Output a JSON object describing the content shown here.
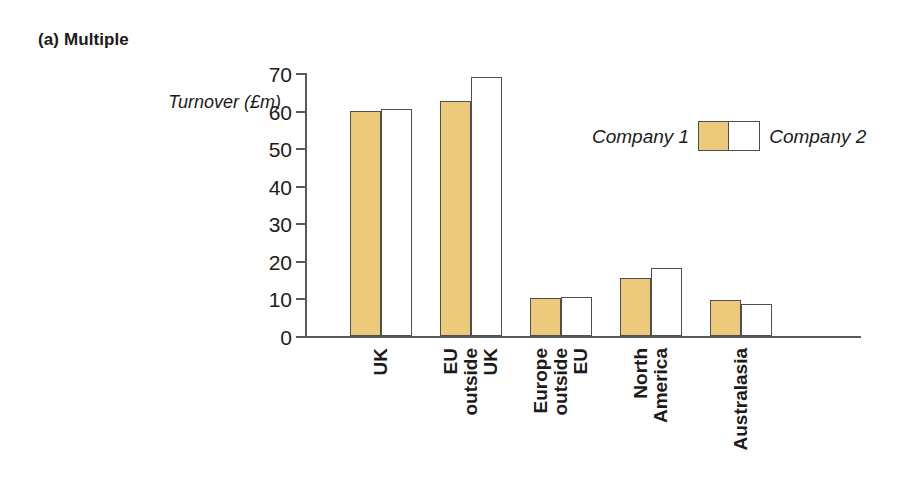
{
  "chart_data": {
    "type": "bar",
    "title": "(a) Multiple",
    "xlabel": "",
    "ylabel": "Turnover (£m)",
    "ylim": [
      0,
      70
    ],
    "yticks": [
      0,
      10,
      20,
      30,
      40,
      50,
      60,
      70
    ],
    "ytick_labels": [
      "0",
      "10",
      "20",
      "30",
      "40",
      "50",
      "60",
      "70"
    ],
    "grid": false,
    "legend_position": "upper right inside",
    "categories": [
      "UK",
      "EU outside UK",
      "Europe outside EU",
      "North America",
      "Australasia"
    ],
    "category_label_lines": [
      [
        "UK"
      ],
      [
        "EU",
        "outside",
        "UK"
      ],
      [
        "Europe",
        "outside",
        "EU"
      ],
      [
        "North",
        "America"
      ],
      [
        "Australasia"
      ]
    ],
    "series": [
      {
        "name": "Company 1",
        "color": "#edc97b",
        "values": [
          60.0,
          62.5,
          10.0,
          15.5,
          9.5
        ]
      },
      {
        "name": "Company 2",
        "color": "#ffffff",
        "values": [
          60.5,
          69.0,
          10.5,
          18.0,
          8.5
        ]
      }
    ],
    "legend": [
      "Company 1",
      "Company 2"
    ],
    "colors": {
      "series_1_fill": "#edc97b",
      "series_2_fill": "#ffffff",
      "bar_outline": "#4c5052",
      "axis": "#555a5c",
      "text": "#1b1b1b",
      "background": "#ffffff"
    }
  }
}
